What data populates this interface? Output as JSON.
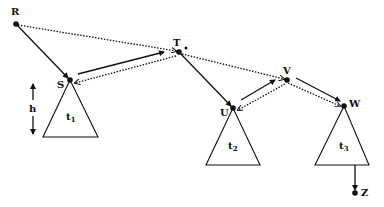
{
  "diagram": {
    "nodes": [
      {
        "id": "R",
        "label": "R",
        "x": 16,
        "y": 24,
        "lx": 11,
        "ly": 15
      },
      {
        "id": "S",
        "label": "S",
        "x": 70,
        "y": 80,
        "lx": 57,
        "ly": 88
      },
      {
        "id": "T",
        "label": "T",
        "x": 179,
        "y": 52,
        "lx": 173,
        "ly": 46
      },
      {
        "id": "U",
        "label": "U",
        "x": 233,
        "y": 108,
        "lx": 220,
        "ly": 116
      },
      {
        "id": "V",
        "label": "V",
        "x": 287,
        "y": 80,
        "lx": 283,
        "ly": 74
      },
      {
        "id": "W",
        "label": "W",
        "x": 344,
        "y": 106,
        "lx": 349,
        "ly": 107
      },
      {
        "id": "Z",
        "label": "Z",
        "x": 355,
        "y": 193,
        "lx": 361,
        "ly": 196
      }
    ],
    "subtrees": [
      {
        "id": "t1",
        "label": "t",
        "sub": "1",
        "apex": "S",
        "base_y": 137,
        "left_x": 43,
        "right_x": 98,
        "lx": 66,
        "ly": 120
      },
      {
        "id": "t2",
        "label": "t",
        "sub": "2",
        "apex": "U",
        "base_y": 165,
        "left_x": 206,
        "right_x": 260,
        "lx": 228,
        "ly": 149
      },
      {
        "id": "t3",
        "label": "t",
        "sub": "3",
        "apex": "W",
        "base_y": 165,
        "left_x": 315,
        "right_x": 369,
        "lx": 339,
        "ly": 149
      }
    ],
    "solid_edges": [
      {
        "from": "R",
        "to": "S"
      },
      {
        "from": "S",
        "to": "T"
      },
      {
        "from": "T",
        "to": "U"
      },
      {
        "from": "U",
        "to": "V"
      },
      {
        "from": "V",
        "to": "W"
      },
      {
        "from": "t3-base",
        "to": "Z"
      }
    ],
    "dotted_edges": [
      {
        "from": "R",
        "to": "T"
      },
      {
        "from": "T",
        "to": "S"
      },
      {
        "from": "T",
        "to": "V"
      },
      {
        "from": "V",
        "to": "U"
      },
      {
        "from": "V",
        "to": "W"
      }
    ],
    "height_marker": {
      "label": "h",
      "x": 33,
      "y_top": 82,
      "y_bottom": 135
    }
  }
}
